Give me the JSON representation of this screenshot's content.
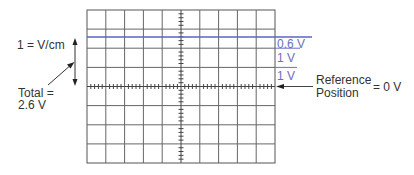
{
  "diagram": {
    "type": "oscilloscope-graticule",
    "grid": {
      "columns": 10,
      "rows": 8
    },
    "trace": {
      "label": "DC trace",
      "divisions_above_reference": 2.6,
      "color": "#5a64c8"
    },
    "labels": {
      "scale": "1 = V/cm",
      "total_line1": "Total =",
      "total_line2": "2.6 V",
      "seg_0_6": "0.6 V",
      "seg_1a": "1 V",
      "seg_1b": "1 V",
      "reference_line1": "Reference",
      "reference_line2": "Position",
      "reference_value": "= 0 V"
    },
    "colors": {
      "grid": "#555555",
      "trace": "#5a64c8",
      "annotation": "#6a6fc0",
      "text": "#333333"
    }
  }
}
